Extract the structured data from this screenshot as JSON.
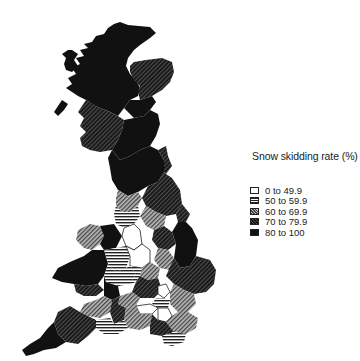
{
  "legend": {
    "title": "Snow skidding rate (%)",
    "items": [
      {
        "label": "0 to 49.9",
        "pattern": "white"
      },
      {
        "label": "50 to 59.9",
        "pattern": "horizontal-lines"
      },
      {
        "label": "60 to 69.9",
        "pattern": "light-diagonal"
      },
      {
        "label": "70 to 79.9",
        "pattern": "dark-diagonal"
      },
      {
        "label": "80 to 100",
        "pattern": "solid-black"
      }
    ]
  },
  "map": {
    "region": "Great Britain",
    "variable": "Snow skidding rate (%)"
  },
  "colors": {
    "ink": "#111111",
    "background": "#ffffff",
    "class_60_69": "#777777",
    "class_70_79": "#333333"
  }
}
